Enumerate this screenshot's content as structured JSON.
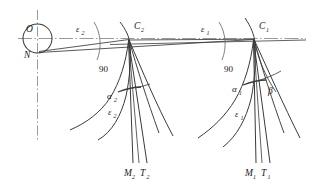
{
  "figure": {
    "type": "geometric-construction-diagram",
    "background_color": "#ffffff",
    "line_color": "#3a3a3a",
    "axis_color": "#8a8a8a",
    "labels": {
      "observer_top": "O",
      "observer_bottom": "N",
      "vertex_left": "C",
      "vertex_left_sub": "2",
      "vertex_right": "C",
      "vertex_right_sub": "1",
      "epsilon_top_left": "ε",
      "epsilon_top_left_sub": "2",
      "epsilon_top_right": "ε",
      "epsilon_top_right_sub": "1",
      "right_angle_left": "90",
      "right_angle_right": "90",
      "alpha_left": "α",
      "alpha_left_sub": "2",
      "alpha_right": "α",
      "alpha_right_sub": "1",
      "epsilon_low_left": "ε",
      "epsilon_low_left_sub": "2",
      "epsilon_low_right": "ε",
      "epsilon_low_right_sub": "1",
      "beta": "β",
      "meridian_left": "M",
      "meridian_left_sub": "2",
      "track_left": "T",
      "track_left_sub": "2",
      "meridian_right": "M",
      "meridian_right_sub": "1",
      "track_right": "T",
      "track_right_sub": "1"
    }
  }
}
